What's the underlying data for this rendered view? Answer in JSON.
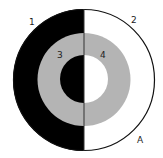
{
  "diagram": {
    "type": "concentric-circles-split",
    "colors": {
      "background": "#ffffff",
      "dark": "#000000",
      "gray": "#b4b4b4",
      "light": "#ffffff",
      "stroke": "#111111"
    },
    "labels": {
      "region1": "1",
      "region2": "2",
      "region3": "3",
      "region4": "4",
      "point_a": "A"
    }
  }
}
